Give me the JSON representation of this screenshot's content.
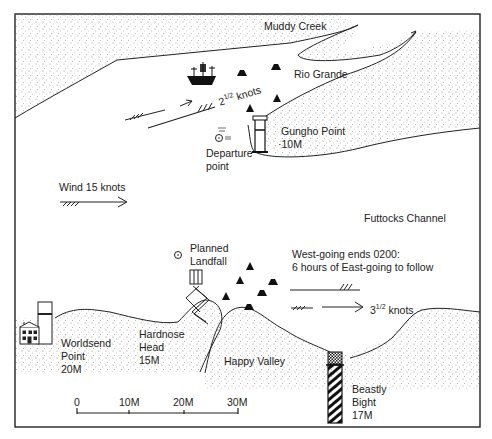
{
  "map": {
    "frame": {
      "left": 15,
      "top": 14,
      "right": 480,
      "bottom": 427
    },
    "colors": {
      "ink": "#1a1a1a",
      "land_stipple": "#9a9a9a",
      "background": "#ffffff"
    },
    "places": {
      "muddy_creek": "Muddy Creek",
      "rio_grande": "Rio Grande",
      "gungho_point": "Gungho Point",
      "gungho_range": "10M",
      "departure_line1": "Departure",
      "departure_line2": "point",
      "futtocks_channel": "Futtocks Channel",
      "planned_line1": "Planned",
      "planned_line2": "Landfall",
      "worldsend_line1": "Worldsend",
      "worldsend_line2": "Point",
      "worldsend_range": "20M",
      "hardnose_line1": "Hardnose",
      "hardnose_line2": "Head",
      "hardnose_range": "15M",
      "happy_valley": "Happy Valley",
      "beastly_line1": "Beastly",
      "beastly_line2": "Bight",
      "beastly_range": "17M"
    },
    "tide": {
      "upper_stream_whole": "2",
      "upper_stream_frac": "1/2",
      "upper_stream_unit": "knots",
      "note_line1": "West-going ends 0200:",
      "note_line2": "6 hours of East-going to follow",
      "lower_stream_whole": "3",
      "lower_stream_frac": "1/2",
      "lower_stream_unit": "knots"
    },
    "wind": {
      "label": "Wind 15 knots"
    },
    "scale": {
      "ticks": [
        "0",
        "10M",
        "20M",
        "30M"
      ]
    },
    "icons": [
      "ship-icon",
      "rock-icon",
      "lighthouse-icon",
      "position-fix-icon",
      "pier-icon",
      "house-icon",
      "striped-beacon-icon",
      "tide-arrow-icon",
      "wind-arrow-icon"
    ]
  }
}
